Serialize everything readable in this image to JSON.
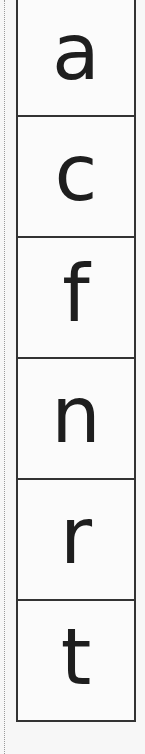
{
  "worksheet": {
    "letters": [
      "a",
      "c",
      "f",
      "n",
      "r",
      "t"
    ]
  },
  "colors": {
    "background": "#f7f7f7",
    "border": "#333333",
    "letter": "#1e1e1e",
    "cut_line": "#9a9a9a"
  }
}
